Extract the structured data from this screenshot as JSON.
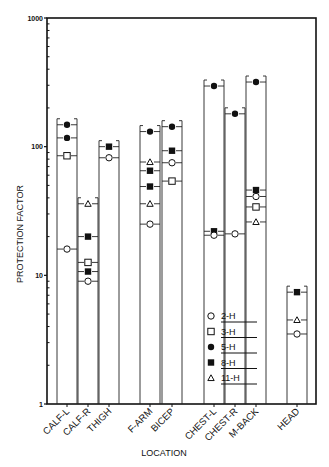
{
  "chart_data": {
    "type": "scatter",
    "title": "",
    "xlabel": "LOCATION",
    "ylabel": "PROTECTION FACTOR",
    "yscale": "log",
    "ylim": [
      1,
      1000
    ],
    "yticks": [
      1,
      10,
      100,
      1000
    ],
    "ytick_labels": [
      "1",
      "10",
      "100",
      "1000"
    ],
    "grid": false,
    "legend_position": "inside lower right",
    "categories": [
      "CALF-L",
      "CALF-R",
      "THIGH",
      "F-ARM",
      "BICEP",
      "CHEST-L",
      "CHEST-R",
      "M-BACK",
      "HEAD"
    ],
    "legend": [
      {
        "key": "2-H",
        "marker": "circle-open"
      },
      {
        "key": "3-H",
        "marker": "square-open"
      },
      {
        "key": "5-H",
        "marker": "circle-filled"
      },
      {
        "key": "8-H",
        "marker": "square-filled"
      },
      {
        "key": "11-H",
        "marker": "triangle-open"
      }
    ],
    "points": [
      {
        "category": "CALF-L",
        "series": "5-H",
        "value": 148
      },
      {
        "category": "CALF-L",
        "series": "5-H",
        "value": 117
      },
      {
        "category": "CALF-L",
        "series": "3-H",
        "value": 85
      },
      {
        "category": "CALF-L",
        "series": "2-H",
        "value": 16
      },
      {
        "category": "CALF-R",
        "series": "11-H",
        "value": 36
      },
      {
        "category": "CALF-R",
        "series": "8-H",
        "value": 20
      },
      {
        "category": "CALF-R",
        "series": "3-H",
        "value": 12.6
      },
      {
        "category": "CALF-R",
        "series": "8-H",
        "value": 10.7
      },
      {
        "category": "CALF-R",
        "series": "2-H",
        "value": 9
      },
      {
        "category": "THIGH",
        "series": "8-H",
        "value": 100
      },
      {
        "category": "THIGH",
        "series": "2-H",
        "value": 82
      },
      {
        "category": "F-ARM",
        "series": "5-H",
        "value": 131
      },
      {
        "category": "F-ARM",
        "series": "11-H",
        "value": 76
      },
      {
        "category": "F-ARM",
        "series": "8-H",
        "value": 65
      },
      {
        "category": "F-ARM",
        "series": "8-H",
        "value": 49
      },
      {
        "category": "F-ARM",
        "series": "11-H",
        "value": 36
      },
      {
        "category": "F-ARM",
        "series": "2-H",
        "value": 25
      },
      {
        "category": "BICEP",
        "series": "5-H",
        "value": 143
      },
      {
        "category": "BICEP",
        "series": "8-H",
        "value": 93
      },
      {
        "category": "BICEP",
        "series": "2-H",
        "value": 75
      },
      {
        "category": "BICEP",
        "series": "3-H",
        "value": 54
      },
      {
        "category": "CHEST-L",
        "series": "5-H",
        "value": 296
      },
      {
        "category": "CHEST-L",
        "series": "8-H",
        "value": 22
      },
      {
        "category": "CHEST-L",
        "series": "2-H",
        "value": 20.5
      },
      {
        "category": "CHEST-R",
        "series": "5-H",
        "value": 180
      },
      {
        "category": "CHEST-R",
        "series": "2-H",
        "value": 21
      },
      {
        "category": "M-BACK",
        "series": "5-H",
        "value": 318
      },
      {
        "category": "M-BACK",
        "series": "8-H",
        "value": 46
      },
      {
        "category": "M-BACK",
        "series": "2-H",
        "value": 41
      },
      {
        "category": "M-BACK",
        "series": "3-H",
        "value": 34
      },
      {
        "category": "M-BACK",
        "series": "11-H",
        "value": 26
      },
      {
        "category": "HEAD",
        "series": "8-H",
        "value": 7.4
      },
      {
        "category": "HEAD",
        "series": "11-H",
        "value": 4.5
      },
      {
        "category": "HEAD",
        "series": "2-H",
        "value": 3.5
      }
    ]
  },
  "axes": {
    "ylabel": "PROTECTION FACTOR",
    "xlabel": "LOCATION"
  }
}
